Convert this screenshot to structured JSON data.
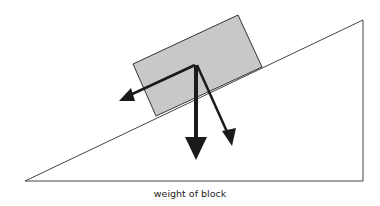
{
  "diagram": {
    "caption": "weight of block",
    "colors": {
      "background": "#ffffff",
      "incline_stroke": "#444444",
      "block_fill": "#c8c8c8",
      "block_stroke": "#333333",
      "arrow": "#1a1a1a"
    },
    "elements": [
      "inclined-plane",
      "block",
      "weight-arrow",
      "perpendicular-component-arrow",
      "parallel-component-arrow"
    ]
  }
}
